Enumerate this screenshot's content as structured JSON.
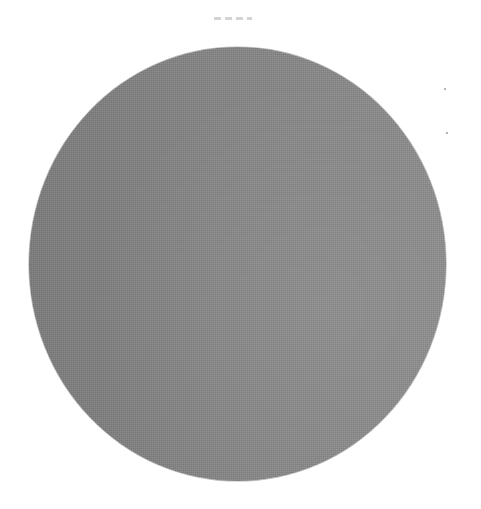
{
  "image": {
    "subject": "gray disc",
    "shape": "circle",
    "fill_color": "#888888",
    "fill_color_dark_side": "#7e7e7e",
    "fill_color_light_side": "#8e8e8e",
    "background_color": "#ffffff",
    "bounds": {
      "left": 29,
      "top": 47,
      "width": 417,
      "height": 434
    }
  },
  "artifacts": {
    "top_scan_mark": {
      "left": 214,
      "top": 17,
      "width": 38,
      "color": "#c8c8c8"
    },
    "specks": [
      {
        "left": 444,
        "top": 88
      },
      {
        "left": 446,
        "top": 132
      }
    ]
  }
}
